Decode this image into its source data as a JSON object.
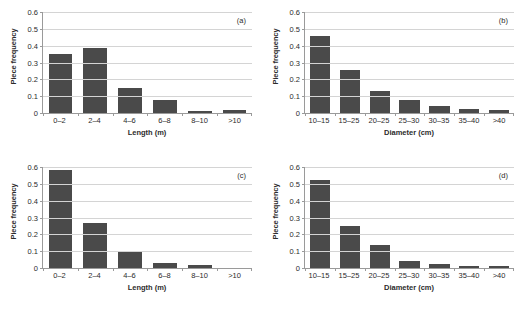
{
  "figure": {
    "background": "#ffffff",
    "bar_color": "#4a4a4a",
    "grid_color": "#d4d4d4",
    "axis_color": "#9a9a9a",
    "text_color": "#2b2b2b"
  },
  "chart_data": [
    {
      "type": "bar",
      "panel": "(a)",
      "title": "",
      "xlabel": "Length (m)",
      "ylabel": "Piece frequency",
      "categories": [
        "0–2",
        "2–4",
        "4–6",
        "6–8",
        "8–10",
        ">10"
      ],
      "values": [
        0.35,
        0.385,
        0.148,
        0.078,
        0.014,
        0.018
      ],
      "ylim": [
        0,
        0.6
      ],
      "yticks": [
        0,
        0.1,
        0.2,
        0.3,
        0.4,
        0.5,
        0.6
      ],
      "ytick_labels": [
        "0",
        "0.1",
        "0.2",
        "0.3",
        "0.4",
        "0.5",
        "0.6"
      ],
      "grid": "horizontal",
      "legend": "none"
    },
    {
      "type": "bar",
      "panel": "(b)",
      "title": "",
      "xlabel": "Diameter (cm)",
      "ylabel": "Piece frequency",
      "categories": [
        "10–15",
        "15–25",
        "20–25",
        "25–30",
        "30–35",
        "35–40",
        ">40"
      ],
      "values": [
        0.455,
        0.253,
        0.128,
        0.079,
        0.044,
        0.022,
        0.018
      ],
      "ylim": [
        0,
        0.6
      ],
      "yticks": [
        0,
        0.1,
        0.2,
        0.3,
        0.4,
        0.5,
        0.6
      ],
      "ytick_labels": [
        "0",
        "0.1",
        "0.2",
        "0.3",
        "0.4",
        "0.5",
        "0.6"
      ],
      "grid": "horizontal",
      "legend": "none"
    },
    {
      "type": "bar",
      "panel": "(c)",
      "title": "",
      "xlabel": "Length (m)",
      "ylabel": "Piece frequency",
      "categories": [
        "0–2",
        "2–4",
        "4–6",
        "6–8",
        "8–10",
        ">10"
      ],
      "values": [
        0.58,
        0.268,
        0.1,
        0.031,
        0.015,
        0.0
      ],
      "ylim": [
        0,
        0.6
      ],
      "yticks": [
        0,
        0.1,
        0.2,
        0.3,
        0.4,
        0.5,
        0.6
      ],
      "ytick_labels": [
        "0",
        "0.1",
        "0.2",
        "0.3",
        "0.4",
        "0.5",
        "0.6"
      ],
      "grid": "horizontal",
      "legend": "none"
    },
    {
      "type": "bar",
      "panel": "(d)",
      "title": "",
      "xlabel": "Diameter (cm)",
      "ylabel": "Piece frequency",
      "categories": [
        "10–15",
        "15–25",
        "20–25",
        "25–30",
        "30–35",
        "35–40",
        ">40"
      ],
      "values": [
        0.523,
        0.249,
        0.136,
        0.042,
        0.022,
        0.014,
        0.012
      ],
      "ylim": [
        0,
        0.6
      ],
      "yticks": [
        0,
        0.1,
        0.2,
        0.3,
        0.4,
        0.5,
        0.6
      ],
      "ytick_labels": [
        "0",
        "0.1",
        "0.2",
        "0.3",
        "0.4",
        "0.5",
        "0.6"
      ],
      "grid": "horizontal",
      "legend": "none"
    }
  ]
}
